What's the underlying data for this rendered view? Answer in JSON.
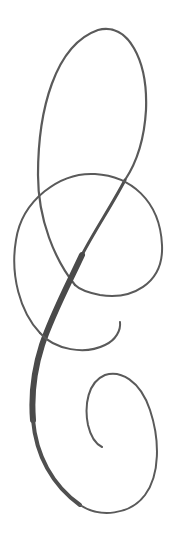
{
  "image": {
    "title": "Calligraphic flourish",
    "background": "#ffffff",
    "ink_color": "#555555",
    "ink_dark": "#4a4a4a"
  },
  "flourish": {
    "parts": [
      {
        "name": "top-loop",
        "description": "tall upper oval loop"
      },
      {
        "name": "middle-loop",
        "description": "wide crossing loop"
      },
      {
        "name": "main-stem",
        "description": "thick diagonal swash stroke"
      },
      {
        "name": "hook",
        "description": "small hook terminal"
      },
      {
        "name": "bottom-spiral",
        "description": "lower inward spiral"
      }
    ]
  }
}
